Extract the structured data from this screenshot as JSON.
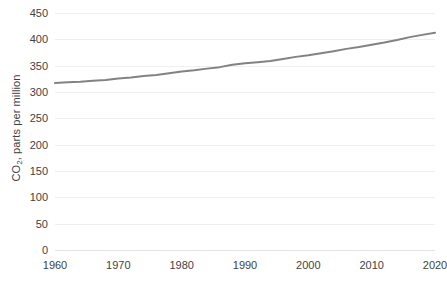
{
  "chart_data": {
    "type": "line",
    "title": "",
    "xlabel": "",
    "ylabel": "CO2, parts per million",
    "ylabel_prefix": "CO",
    "ylabel_sub": "2",
    "ylabel_suffix": ", parts per million",
    "xlim": [
      1960,
      2020
    ],
    "ylim": [
      0,
      450
    ],
    "ytick_step": 50,
    "xtick_step": 10,
    "grid": "horizontal",
    "legend": "none",
    "yticks": [
      "450",
      "400",
      "350",
      "300",
      "250",
      "200",
      "150",
      "100",
      "50",
      "0"
    ],
    "ytick_values": [
      450,
      400,
      350,
      300,
      250,
      200,
      150,
      100,
      50,
      0
    ],
    "xticks": [
      "1960",
      "1970",
      "1980",
      "1990",
      "2000",
      "2010",
      "2020"
    ],
    "xtick_values": [
      1960,
      1970,
      1980,
      1990,
      2000,
      2010,
      2020
    ],
    "series": [
      {
        "name": "CO2 concentration",
        "color": "#828282",
        "line_width": 2,
        "x": [
          1960,
          1962,
          1964,
          1966,
          1968,
          1970,
          1972,
          1974,
          1976,
          1978,
          1980,
          1982,
          1984,
          1986,
          1988,
          1990,
          1992,
          1994,
          1996,
          1998,
          2000,
          2002,
          2004,
          2006,
          2008,
          2010,
          2012,
          2014,
          2016,
          2018,
          2020
        ],
        "values": [
          316.9,
          318.4,
          319.6,
          321.4,
          323.0,
          325.7,
          327.4,
          330.2,
          332.1,
          335.4,
          338.8,
          341.2,
          344.4,
          347.2,
          351.6,
          354.4,
          356.4,
          358.8,
          362.6,
          366.7,
          369.6,
          373.5,
          377.5,
          381.9,
          385.6,
          389.9,
          393.8,
          398.6,
          404.2,
          408.5,
          412.5
        ]
      }
    ]
  },
  "corner": {
    "mark": ""
  }
}
